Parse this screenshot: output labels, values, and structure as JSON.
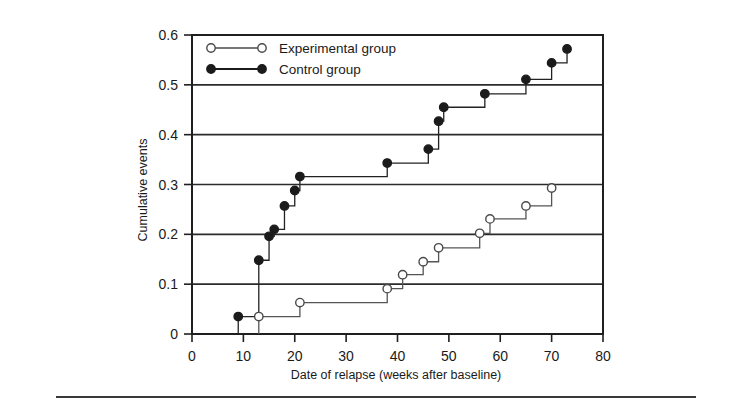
{
  "chart_data": {
    "type": "line",
    "subtype": "step",
    "title": "",
    "xlabel": "Date of relapse (weeks after baseline)",
    "ylabel": "Cumulative events",
    "xlim": [
      0,
      80
    ],
    "ylim": [
      0,
      0.6
    ],
    "xticks": [
      0,
      10,
      20,
      30,
      40,
      50,
      60,
      70,
      80
    ],
    "xtick_labels": [
      "0",
      "10",
      "20",
      "30",
      "40",
      "50",
      "60",
      "70",
      "80"
    ],
    "yticks": [
      0,
      0.1,
      0.2,
      0.3,
      0.4,
      0.5,
      0.6
    ],
    "ytick_labels": [
      "0",
      "0.1",
      "0.2",
      "0.3",
      "0.4",
      "0.5",
      "0.6"
    ],
    "grid": "horizontal",
    "gridlines_y": [
      0.1,
      0.2,
      0.3,
      0.4,
      0.5
    ],
    "legend_position": "top-left",
    "series": [
      {
        "name": "Experimental group",
        "marker": "open-circle",
        "color": "#555555",
        "x": [
          13,
          21,
          38,
          41,
          45,
          48,
          56,
          58,
          65,
          70
        ],
        "y": [
          0.035,
          0.063,
          0.091,
          0.119,
          0.145,
          0.173,
          0.202,
          0.231,
          0.257,
          0.293
        ]
      },
      {
        "name": "Control group",
        "marker": "filled-circle",
        "color": "#222222",
        "x": [
          9,
          13,
          15,
          16,
          18,
          20,
          21,
          38,
          46,
          48,
          49,
          57,
          65,
          70,
          73
        ],
        "y": [
          0.035,
          0.148,
          0.196,
          0.21,
          0.257,
          0.288,
          0.316,
          0.343,
          0.371,
          0.427,
          0.455,
          0.482,
          0.511,
          0.544,
          0.572
        ]
      }
    ]
  },
  "legend": {
    "items": [
      {
        "label": "Experimental group",
        "marker": "open-circle"
      },
      {
        "label": "Control group",
        "marker": "filled-circle"
      }
    ]
  },
  "axes": {
    "x_title": "Date of relapse (weeks after baseline)",
    "y_title": "Cumulative events"
  }
}
